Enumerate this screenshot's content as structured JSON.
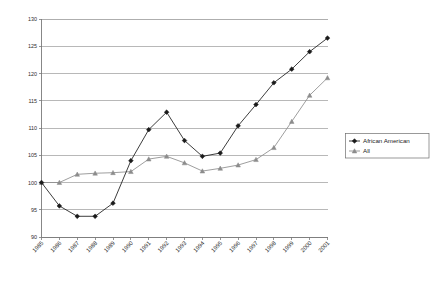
{
  "chart_data": {
    "type": "line",
    "title": "",
    "subtitle": "",
    "xlabel": "",
    "ylabel": "",
    "x": [
      1985,
      1986,
      1987,
      1988,
      1989,
      1990,
      1991,
      1992,
      1993,
      1994,
      1995,
      1996,
      1997,
      1998,
      1999,
      2000,
      2001
    ],
    "categories": [
      "1985",
      "1986",
      "1987",
      "1988",
      "1989",
      "1990",
      "1991",
      "1992",
      "1993",
      "1994",
      "1995",
      "1996",
      "1997",
      "1998",
      "1999",
      "2000",
      "2001"
    ],
    "xlim": [
      1985,
      2001
    ],
    "ylim": [
      90,
      130
    ],
    "yticks": [
      90,
      95,
      100,
      105,
      110,
      115,
      120,
      125,
      130
    ],
    "ytick_labels": [
      "90",
      "95",
      "100",
      "105",
      "110",
      "115",
      "120",
      "125",
      "130"
    ],
    "grid": "horizontal",
    "legend_position": "right",
    "xtick_rotation": -45,
    "series": [
      {
        "name": "African American",
        "marker": "diamond",
        "color": "#1a1a1a",
        "values": [
          100.0,
          95.7,
          93.8,
          93.8,
          96.2,
          104.0,
          109.7,
          112.9,
          107.7,
          104.8,
          105.4,
          110.4,
          114.3,
          118.3,
          120.8,
          124.0,
          126.5
        ]
      },
      {
        "name": "All",
        "marker": "triangle",
        "color": "#8c8c8c",
        "values": [
          100.0,
          100.0,
          101.5,
          101.7,
          101.8,
          102.0,
          104.3,
          104.8,
          103.6,
          102.1,
          102.6,
          103.2,
          104.2,
          106.4,
          111.2,
          116.0,
          119.2
        ]
      }
    ]
  },
  "legend": {
    "items": [
      {
        "label": "African American",
        "marker": "diamond",
        "color": "#1a1a1a"
      },
      {
        "label": "All",
        "marker": "triangle",
        "color": "#8c8c8c"
      }
    ]
  },
  "colors": {
    "series_african_american": "#1a1a1a",
    "series_all": "#8c8c8c",
    "gridline": "#9a9a9a",
    "axis": "#7a7a7a",
    "background": "#ffffff",
    "text": "#2b2b2b"
  }
}
